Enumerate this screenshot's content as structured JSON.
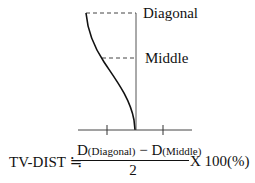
{
  "diagram": {
    "labels": {
      "top": "Diagonal",
      "middle": "Middle"
    },
    "geometry": {
      "vertical_x": 136,
      "top_y": 13,
      "middle_y": 58,
      "baseline_y": 130,
      "baseline_x": [
        78,
        192
      ],
      "ticks_x": [
        107,
        163
      ]
    }
  },
  "formula": {
    "lhs": "TV-DIST ≒",
    "numerator_d1": "D",
    "numerator_d1_sub": "(Diagonal)",
    "numerator_op": " − ",
    "numerator_d2": "D",
    "numerator_d2_sub": "(Middle)",
    "denominator": "2",
    "rhs": "X 100(%)"
  }
}
